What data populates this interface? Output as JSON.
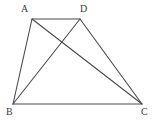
{
  "figure": {
    "name": "quadrilateral-with-diagonals",
    "canvas": {
      "width": 155,
      "height": 124,
      "background": "#ffffff"
    },
    "stroke": {
      "color": "#4a4a4a",
      "width": 1.1
    },
    "vertices": [
      {
        "id": "A",
        "label": "A",
        "x": 32,
        "y": 19,
        "label_x": 21,
        "label_y": 4
      },
      {
        "id": "D",
        "label": "D",
        "x": 80,
        "y": 19,
        "label_x": 80,
        "label_y": 4
      },
      {
        "id": "B",
        "label": "B",
        "x": 13,
        "y": 104,
        "label_x": 6,
        "label_y": 107
      },
      {
        "id": "C",
        "label": "C",
        "x": 142,
        "y": 104,
        "label_x": 141,
        "label_y": 107
      }
    ],
    "edges": [
      {
        "id": "AD",
        "from": "A",
        "to": "D",
        "kind": "side"
      },
      {
        "id": "AB",
        "from": "A",
        "to": "B",
        "kind": "side"
      },
      {
        "id": "BC",
        "from": "B",
        "to": "C",
        "kind": "side"
      },
      {
        "id": "DC",
        "from": "D",
        "to": "C",
        "kind": "side"
      },
      {
        "id": "AC",
        "from": "A",
        "to": "C",
        "kind": "diagonal"
      },
      {
        "id": "BD",
        "from": "B",
        "to": "D",
        "kind": "diagonal"
      }
    ],
    "intersection": {
      "id": "AC-BD",
      "x": 61,
      "y": 40,
      "labeled": false
    }
  }
}
